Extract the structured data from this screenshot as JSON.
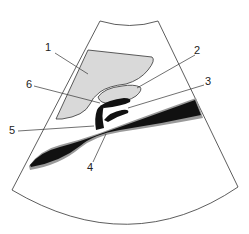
{
  "diagram": {
    "type": "ultrasound-schematic",
    "colors": {
      "background": "#ffffff",
      "outline": "#333333",
      "organ_fill": "#d9d9d9",
      "vessel_fill": "#111111",
      "vessel_halo": "#9a9a9a"
    },
    "labels": [
      {
        "id": "1",
        "text": "1",
        "x": 47,
        "y": 45
      },
      {
        "id": "2",
        "text": "2",
        "x": 196,
        "y": 48
      },
      {
        "id": "3",
        "text": "3",
        "x": 205,
        "y": 79
      },
      {
        "id": "4",
        "text": "4",
        "x": 88,
        "y": 164
      },
      {
        "id": "5",
        "text": "5",
        "x": 10,
        "y": 125
      },
      {
        "id": "6",
        "text": "6",
        "x": 27,
        "y": 80
      }
    ]
  }
}
